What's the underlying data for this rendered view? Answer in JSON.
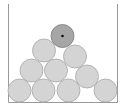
{
  "diagram": {
    "type": "stacked-balls-in-container",
    "container": {
      "left_x": 8,
      "right_x": 117,
      "top_y": 4,
      "bottom_y": 102,
      "stroke": "#9a9a9a"
    },
    "ball_radius": 11.5,
    "ball_fill": "#d4d4d4",
    "ball_stroke": "#a8a8a8",
    "highlight_fill": "#a6a6a6",
    "highlight_stroke": "#7e7e7e",
    "center_dot_color": "#111111",
    "balls": [
      {
        "id": "b1",
        "cx": 19.5,
        "cy": 90.5,
        "highlight": false
      },
      {
        "id": "b2",
        "cx": 43.5,
        "cy": 90.5,
        "highlight": false
      },
      {
        "id": "b3",
        "cx": 68.5,
        "cy": 90.5,
        "highlight": false
      },
      {
        "id": "b4",
        "cx": 105.5,
        "cy": 90.5,
        "highlight": false
      },
      {
        "id": "b5",
        "cx": 31.5,
        "cy": 70.5,
        "highlight": false
      },
      {
        "id": "b6",
        "cx": 56,
        "cy": 70.5,
        "highlight": false
      },
      {
        "id": "b7",
        "cx": 87,
        "cy": 76.5,
        "highlight": false
      },
      {
        "id": "b8",
        "cx": 44,
        "cy": 50.5,
        "highlight": false
      },
      {
        "id": "b9",
        "cx": 75,
        "cy": 56.5,
        "highlight": false
      },
      {
        "id": "b10",
        "cx": 62.5,
        "cy": 36,
        "highlight": true
      }
    ]
  }
}
